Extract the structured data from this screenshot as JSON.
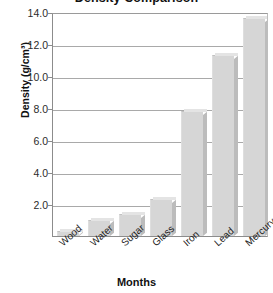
{
  "chart_data": {
    "type": "bar",
    "title": "Density Comparison",
    "xlabel": "Months",
    "ylabel": "Density (g/cm³)",
    "categories": [
      "Wood",
      "Water",
      "Sugar",
      "Glass",
      "Iron",
      "Lead",
      "Mercury"
    ],
    "values": [
      0.3,
      1.0,
      1.4,
      2.3,
      7.8,
      11.3,
      13.6
    ],
    "ylim": [
      0.0,
      14.0
    ],
    "ytick_labels": [
      "14.0",
      "12.0",
      "10.0",
      "8.0",
      "6.0",
      "4.0",
      "2.0"
    ],
    "ytick_values": [
      14.0,
      12.0,
      10.0,
      8.0,
      6.0,
      4.0,
      2.0
    ],
    "grid": true,
    "legend": false,
    "bar_color": "#d6d6d6",
    "grid_color": "#a9a9a9",
    "axis_color": "#8c8c8c"
  }
}
